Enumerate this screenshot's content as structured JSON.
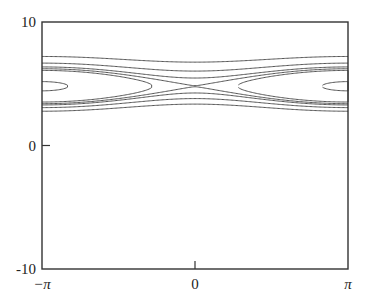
{
  "chart_data": {
    "type": "line",
    "title": "",
    "xlabel": "",
    "ylabel": "",
    "xlim": [
      -3.14159,
      3.14159
    ],
    "ylim": [
      -10,
      10
    ],
    "grid": false,
    "legend": null,
    "x_ticks": [
      {
        "value": -3.14159,
        "label": "−π",
        "italic": true
      },
      {
        "value": 0,
        "label": "0",
        "italic": false
      },
      {
        "value": 3.14159,
        "label": "π",
        "italic": true
      }
    ],
    "y_ticks": [
      {
        "value": -10,
        "label": "-10"
      },
      {
        "value": 0,
        "label": "0"
      },
      {
        "value": 10,
        "label": "10"
      }
    ],
    "model": {
      "p0": 4.8,
      "A": 0.5
    },
    "contour_levels": [
      4.9,
      2.4,
      1.0,
      0.85,
      0.2,
      -0.3,
      1.6,
      2.9
    ],
    "series": [
      {
        "name": "passing orbit top",
        "edge_p": 7.0,
        "center_p": 6.95
      },
      {
        "name": "passing orbit 2",
        "edge_p": 6.3,
        "center_p": 6.1
      },
      {
        "name": "passing orbit 3 (above separatrix)",
        "edge_p": 5.7,
        "center_p": 5.25
      },
      {
        "name": "separatrix",
        "edge_p_upper": 6.2,
        "edge_p_lower": 3.4,
        "center_p": 4.8
      },
      {
        "name": "island large",
        "center_p": 4.8,
        "x_extent": 2.3
      },
      {
        "name": "island small",
        "center_p": 4.8,
        "x_extent": 2.8
      },
      {
        "name": "passing orbit below 1",
        "edge_p": 3.8,
        "center_p": 4.3
      },
      {
        "name": "passing orbit below 2",
        "edge_p": 3.2,
        "center_p": 3.55
      }
    ],
    "style": {
      "line_color": "#555555",
      "axis_color": "#333333",
      "background": "#ffffff"
    }
  }
}
